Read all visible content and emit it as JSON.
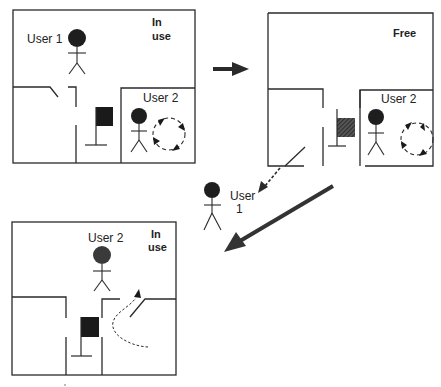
{
  "diagram": {
    "panels": [
      {
        "id": "panel-a",
        "status": [
          "In",
          "use"
        ],
        "users": [
          "User 1",
          "User 2"
        ],
        "object_state": "solid-flag"
      },
      {
        "id": "panel-b",
        "status": [
          "Free"
        ],
        "users": [
          "User 2"
        ],
        "object_state": "hatched-flag"
      },
      {
        "id": "panel-c",
        "status": [
          "In",
          "use"
        ],
        "users": [
          "User 2"
        ],
        "object_state": "solid-flag"
      }
    ],
    "departing_user": [
      "User",
      "1"
    ],
    "arrows": [
      {
        "from": "panel-a",
        "to": "panel-b",
        "style": "thick-solid"
      },
      {
        "from": "panel-b",
        "to": "departing-user",
        "style": "dashed"
      },
      {
        "from": "panel-b",
        "to": "panel-c",
        "style": "thick-solid-diagonal"
      }
    ],
    "colors": {
      "line": "#2a2a2a",
      "fill_dark": "#1a1a1a",
      "user_head": "#1e1e1e",
      "user_head_c": "#3a3a3a",
      "arrow": "#333333"
    }
  }
}
